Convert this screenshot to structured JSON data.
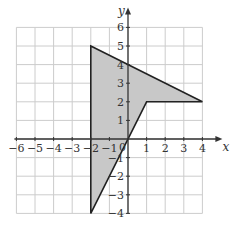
{
  "diagram": {
    "type": "coordinate-plane-polygon",
    "x_axis": {
      "label": "x",
      "min": -6,
      "max": 4,
      "ticks": [
        "-6",
        "-5",
        "-4",
        "-3",
        "-2",
        "-1",
        "1",
        "2",
        "3",
        "4"
      ]
    },
    "y_axis": {
      "label": "y",
      "min": -4,
      "max": 6,
      "ticks": [
        "6",
        "5",
        "4",
        "3",
        "2",
        "1",
        "-1",
        "-2",
        "-3",
        "-4"
      ]
    },
    "origin_label": "0",
    "polygon": {
      "vertices": [
        [
          -2,
          5
        ],
        [
          4,
          2
        ],
        [
          1,
          2
        ],
        [
          -2,
          -4
        ]
      ],
      "fill": "#c8c8c8",
      "stroke": "#222222"
    },
    "grid_color": "#cccccc"
  }
}
